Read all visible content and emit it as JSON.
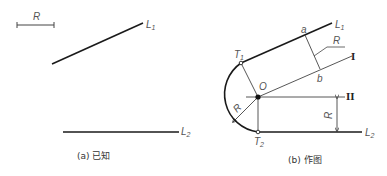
{
  "panel_a": {
    "scale_label": "R",
    "line1_label": "L",
    "line1_sub": "1",
    "line2_label": "L",
    "line2_sub": "2",
    "caption": "(a) 已知"
  },
  "panel_b": {
    "line1_label": "L",
    "line1_sub": "1",
    "line2_label": "L",
    "line2_sub": "2",
    "tangent1_label": "T",
    "tangent1_sub": "1",
    "tangent2_label": "T",
    "tangent2_sub": "2",
    "center_label": "O",
    "point_a_label": "a",
    "point_b_label": "b",
    "radius_label_leader": "R",
    "radius_label_arc": "R",
    "radius_label_vertical": "R",
    "offset_line1_label": "I",
    "offset_line2_label": "II",
    "caption": "(b) 作图"
  },
  "colors": {
    "stroke": "#1a1a1a",
    "thin": "#444444",
    "label": "#555555"
  }
}
